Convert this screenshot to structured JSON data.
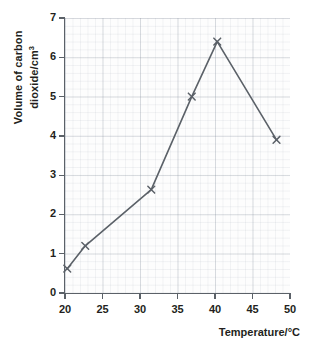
{
  "chart_data": {
    "type": "line",
    "title": "",
    "xlabel": "Temperature/°C",
    "ylabel_line1": "Volume of carbon",
    "ylabel_line2": "dioxide/cm",
    "ylabel_superscript": "3",
    "ylabel_full": "Volume of carbon dioxide/cm³",
    "x": [
      20.3,
      22.7,
      31.5,
      36.9,
      40.3,
      48.2
    ],
    "y": [
      0.62,
      1.2,
      2.63,
      5.0,
      6.4,
      3.9
    ],
    "points": [
      {
        "x": 20.3,
        "y": 0.62
      },
      {
        "x": 22.7,
        "y": 1.2
      },
      {
        "x": 31.5,
        "y": 2.63
      },
      {
        "x": 36.9,
        "y": 5.0
      },
      {
        "x": 40.3,
        "y": 6.4
      },
      {
        "x": 48.2,
        "y": 3.9
      }
    ],
    "xlim": [
      20,
      50
    ],
    "ylim": [
      0,
      7
    ],
    "xticks": [
      20,
      25,
      30,
      35,
      40,
      45,
      50
    ],
    "yticks": [
      0,
      1,
      2,
      3,
      4,
      5,
      6,
      7
    ],
    "xtick_labels": [
      "20",
      "25",
      "30",
      "35",
      "40",
      "45",
      "50"
    ],
    "ytick_labels": [
      "0",
      "1",
      "2",
      "3",
      "4",
      "5",
      "6",
      "7"
    ],
    "grid": true,
    "grid_minor": true,
    "legend": null,
    "marker": "x",
    "series_color": "#5b6168",
    "grid_color": "#8c96a5",
    "axis_color": "#5b6168",
    "text_color": "#231f20",
    "background": "#ffffff"
  }
}
